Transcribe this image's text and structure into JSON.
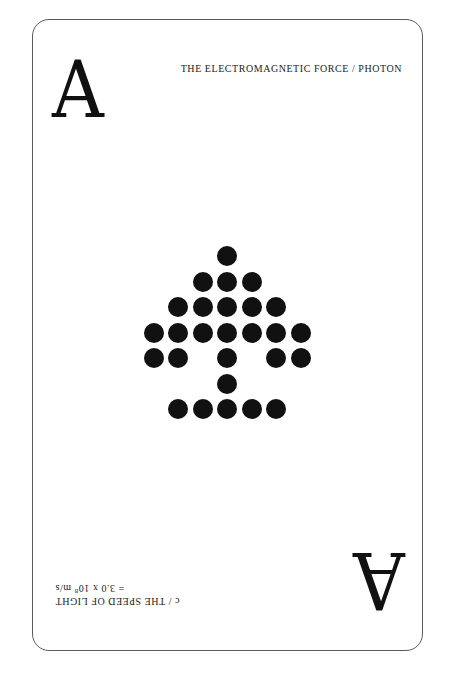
{
  "card": {
    "rank": "A",
    "suit": "spade",
    "border_color": "#5a5a5a",
    "ink_color": "#111111",
    "top_corner": {
      "rank": "A",
      "caption_lines": [
        "THE ELECTROMAGNETIC FORCE / PHOTON"
      ]
    },
    "bottom_corner": {
      "rank": "A",
      "rotated_degrees": 180,
      "caption_line_1": "c / THE SPEED OF LIGHT",
      "caption_line_2_prefix": "= 3.0 x 10",
      "caption_line_2_exponent": "8",
      "caption_line_2_suffix": " m/s"
    },
    "pip": {
      "name": "spade-dot-matrix",
      "grid_columns": 7,
      "grid_rows": 7,
      "rows": [
        [
          3
        ],
        [
          2,
          3,
          4
        ],
        [
          1,
          2,
          3,
          4,
          5
        ],
        [
          0,
          1,
          2,
          3,
          4,
          5,
          6
        ],
        [
          0,
          1,
          3,
          5,
          6
        ],
        [
          3
        ],
        [
          1,
          2,
          3,
          4,
          5
        ]
      ]
    }
  }
}
